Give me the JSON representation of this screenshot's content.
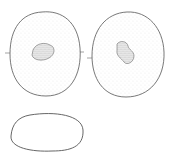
{
  "figure": {
    "views": [
      {
        "name": "face-view-left",
        "shape": "ovoid with central granular body"
      },
      {
        "name": "face-view-right",
        "shape": "ovoid with central granular body"
      },
      {
        "name": "side-view",
        "shape": "flattened ellipse outline"
      }
    ],
    "colors": {
      "ink": "#555555",
      "stipple": "#9a9a9a",
      "background": "#ffffff"
    }
  }
}
